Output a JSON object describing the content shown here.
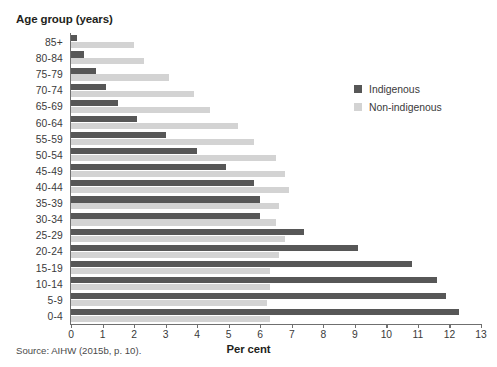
{
  "axis_title_y": "Age group (years)",
  "axis_title_x": "Per cent",
  "source": "Source: AIHW (2015b, p. 10).",
  "legend": {
    "position": "top-right-inside",
    "items": [
      {
        "label": "Indigenous",
        "color": "#575757"
      },
      {
        "label": "Non-indigenous",
        "color": "#d3d3d3"
      }
    ]
  },
  "chart_data": {
    "type": "bar",
    "orientation": "horizontal",
    "title": "",
    "xlabel": "Per cent",
    "ylabel": "Age group (years)",
    "xlim": [
      0,
      13
    ],
    "xticks": [
      "0",
      "1",
      "2",
      "3",
      "4",
      "5",
      "6",
      "7",
      "8",
      "9",
      "10",
      "11",
      "12",
      "13"
    ],
    "grid": false,
    "legend_position": "top-right-inside",
    "categories": [
      "85+",
      "80-84",
      "75-79",
      "70-74",
      "65-69",
      "60-64",
      "55-59",
      "50-54",
      "45-49",
      "40-44",
      "35-39",
      "30-34",
      "25-29",
      "20-24",
      "15-19",
      "10-14",
      "5-9",
      "0-4"
    ],
    "series": [
      {
        "name": "Indigenous",
        "color": "#575757",
        "values": [
          0.2,
          0.4,
          0.8,
          1.1,
          1.5,
          2.1,
          3.0,
          4.0,
          4.9,
          5.8,
          6.0,
          6.0,
          7.4,
          9.1,
          10.8,
          11.6,
          11.9,
          12.3
        ]
      },
      {
        "name": "Non-indigenous",
        "color": "#d3d3d3",
        "values": [
          2.0,
          2.3,
          3.1,
          3.9,
          4.4,
          5.3,
          5.8,
          6.5,
          6.8,
          6.9,
          6.6,
          6.5,
          6.8,
          6.6,
          6.3,
          6.3,
          6.2,
          6.3
        ]
      }
    ]
  }
}
